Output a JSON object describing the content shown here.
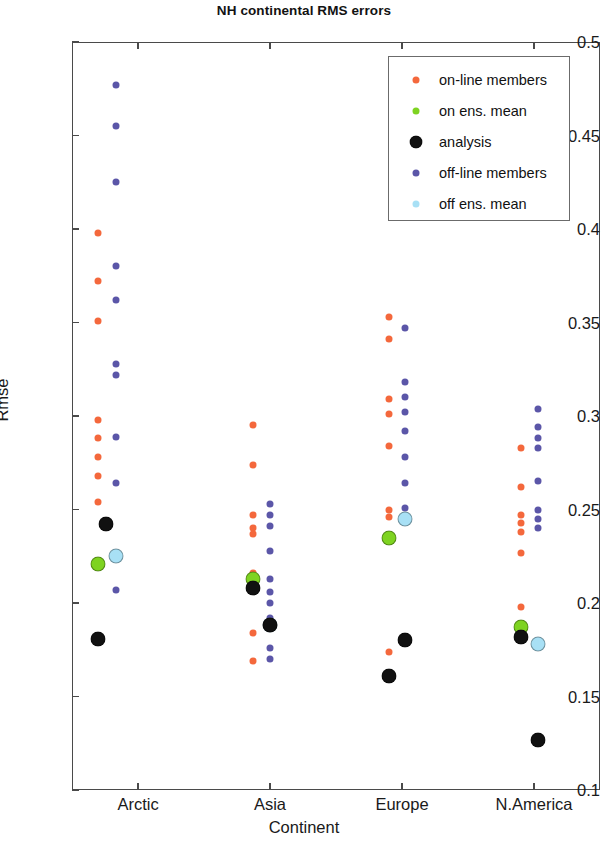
{
  "chart_data": {
    "type": "scatter",
    "title": "NH continental RMS errors",
    "xlabel": "Continent",
    "ylabel": "Rmse",
    "categories": [
      "Arctic",
      "Asia",
      "Europe",
      "N.America"
    ],
    "ylim": [
      0.1,
      0.5
    ],
    "yticks": [
      0.1,
      0.15,
      0.2,
      0.25,
      0.3,
      0.35,
      0.4,
      0.45,
      0.5
    ],
    "ytick_labels": [
      "0.1",
      "0.15",
      "0.2",
      "0.25",
      "0.3",
      "0.35",
      "0.4",
      "0.45",
      "0.5"
    ],
    "grid": false,
    "legend_position": "top-right",
    "colors": {
      "on-line members": "#f4683c",
      "on ens. mean": "#7ed321",
      "analysis": "#111111",
      "off-line members": "#5b56a8",
      "off ens. mean": "#a8e0f5"
    },
    "legend": [
      {
        "label": "on-line members",
        "color": "#f4683c",
        "size": "small"
      },
      {
        "label": "on ens. mean",
        "color": "#7ed321",
        "size": "small"
      },
      {
        "label": " analysis",
        "color": "#111111",
        "size": "big"
      },
      {
        "label": "off-line members",
        "color": "#5b56a8",
        "size": "small"
      },
      {
        "label": "off ens. mean",
        "color": "#a8e0f5",
        "size": "small"
      }
    ],
    "series": [
      {
        "name": "on-line members",
        "color": "#f4683c",
        "size": "small",
        "points": [
          {
            "cat": "Arctic",
            "dx": -0.3,
            "y": 0.398
          },
          {
            "cat": "Arctic",
            "dx": -0.3,
            "y": 0.372
          },
          {
            "cat": "Arctic",
            "dx": -0.3,
            "y": 0.351
          },
          {
            "cat": "Arctic",
            "dx": -0.3,
            "y": 0.298
          },
          {
            "cat": "Arctic",
            "dx": -0.3,
            "y": 0.288
          },
          {
            "cat": "Arctic",
            "dx": -0.3,
            "y": 0.278
          },
          {
            "cat": "Arctic",
            "dx": -0.3,
            "y": 0.268
          },
          {
            "cat": "Arctic",
            "dx": -0.3,
            "y": 0.254
          },
          {
            "cat": "Asia",
            "dx": -0.13,
            "y": 0.295
          },
          {
            "cat": "Asia",
            "dx": -0.13,
            "y": 0.274
          },
          {
            "cat": "Asia",
            "dx": -0.13,
            "y": 0.247
          },
          {
            "cat": "Asia",
            "dx": -0.13,
            "y": 0.24
          },
          {
            "cat": "Asia",
            "dx": -0.13,
            "y": 0.237
          },
          {
            "cat": "Asia",
            "dx": -0.13,
            "y": 0.216
          },
          {
            "cat": "Asia",
            "dx": -0.13,
            "y": 0.21
          },
          {
            "cat": "Asia",
            "dx": -0.13,
            "y": 0.184
          },
          {
            "cat": "Asia",
            "dx": -0.13,
            "y": 0.169
          },
          {
            "cat": "Europe",
            "dx": -0.1,
            "y": 0.353
          },
          {
            "cat": "Europe",
            "dx": -0.1,
            "y": 0.341
          },
          {
            "cat": "Europe",
            "dx": -0.1,
            "y": 0.309
          },
          {
            "cat": "Europe",
            "dx": -0.1,
            "y": 0.301
          },
          {
            "cat": "Europe",
            "dx": -0.1,
            "y": 0.284
          },
          {
            "cat": "Europe",
            "dx": -0.1,
            "y": 0.25
          },
          {
            "cat": "Europe",
            "dx": -0.1,
            "y": 0.246
          },
          {
            "cat": "Europe",
            "dx": -0.1,
            "y": 0.174
          },
          {
            "cat": "N.America",
            "dx": -0.1,
            "y": 0.283
          },
          {
            "cat": "N.America",
            "dx": -0.1,
            "y": 0.262
          },
          {
            "cat": "N.America",
            "dx": -0.1,
            "y": 0.247
          },
          {
            "cat": "N.America",
            "dx": -0.1,
            "y": 0.243
          },
          {
            "cat": "N.America",
            "dx": -0.1,
            "y": 0.238
          },
          {
            "cat": "N.America",
            "dx": -0.1,
            "y": 0.227
          },
          {
            "cat": "N.America",
            "dx": -0.1,
            "y": 0.198
          }
        ]
      },
      {
        "name": "off-line members",
        "color": "#5b56a8",
        "size": "small",
        "points": [
          {
            "cat": "Arctic",
            "dx": -0.17,
            "y": 0.477
          },
          {
            "cat": "Arctic",
            "dx": -0.17,
            "y": 0.455
          },
          {
            "cat": "Arctic",
            "dx": -0.17,
            "y": 0.425
          },
          {
            "cat": "Arctic",
            "dx": -0.17,
            "y": 0.38
          },
          {
            "cat": "Arctic",
            "dx": -0.17,
            "y": 0.362
          },
          {
            "cat": "Arctic",
            "dx": -0.17,
            "y": 0.328
          },
          {
            "cat": "Arctic",
            "dx": -0.17,
            "y": 0.322
          },
          {
            "cat": "Arctic",
            "dx": -0.17,
            "y": 0.289
          },
          {
            "cat": "Arctic",
            "dx": -0.17,
            "y": 0.264
          },
          {
            "cat": "Arctic",
            "dx": -0.17,
            "y": 0.207
          },
          {
            "cat": "Asia",
            "dx": 0.0,
            "y": 0.253
          },
          {
            "cat": "Asia",
            "dx": 0.0,
            "y": 0.247
          },
          {
            "cat": "Asia",
            "dx": 0.0,
            "y": 0.241
          },
          {
            "cat": "Asia",
            "dx": 0.0,
            "y": 0.228
          },
          {
            "cat": "Asia",
            "dx": 0.0,
            "y": 0.213
          },
          {
            "cat": "Asia",
            "dx": 0.0,
            "y": 0.206
          },
          {
            "cat": "Asia",
            "dx": 0.0,
            "y": 0.2
          },
          {
            "cat": "Asia",
            "dx": 0.0,
            "y": 0.192
          },
          {
            "cat": "Asia",
            "dx": 0.0,
            "y": 0.176
          },
          {
            "cat": "Asia",
            "dx": 0.0,
            "y": 0.17
          },
          {
            "cat": "Europe",
            "dx": 0.02,
            "y": 0.347
          },
          {
            "cat": "Europe",
            "dx": 0.02,
            "y": 0.318
          },
          {
            "cat": "Europe",
            "dx": 0.02,
            "y": 0.31
          },
          {
            "cat": "Europe",
            "dx": 0.02,
            "y": 0.302
          },
          {
            "cat": "Europe",
            "dx": 0.02,
            "y": 0.292
          },
          {
            "cat": "Europe",
            "dx": 0.02,
            "y": 0.278
          },
          {
            "cat": "Europe",
            "dx": 0.02,
            "y": 0.264
          },
          {
            "cat": "Europe",
            "dx": 0.02,
            "y": 0.251
          },
          {
            "cat": "N.America",
            "dx": 0.03,
            "y": 0.304
          },
          {
            "cat": "N.America",
            "dx": 0.03,
            "y": 0.294
          },
          {
            "cat": "N.America",
            "dx": 0.03,
            "y": 0.288
          },
          {
            "cat": "N.America",
            "dx": 0.03,
            "y": 0.283
          },
          {
            "cat": "N.America",
            "dx": 0.03,
            "y": 0.265
          },
          {
            "cat": "N.America",
            "dx": 0.03,
            "y": 0.25
          },
          {
            "cat": "N.America",
            "dx": 0.03,
            "y": 0.245
          },
          {
            "cat": "N.America",
            "dx": 0.03,
            "y": 0.24
          }
        ]
      },
      {
        "name": "on ens. mean",
        "color": "#7ed321",
        "size": "big",
        "points": [
          {
            "cat": "Arctic",
            "dx": -0.3,
            "y": 0.221
          },
          {
            "cat": "Asia",
            "dx": -0.13,
            "y": 0.213
          },
          {
            "cat": "Europe",
            "dx": -0.1,
            "y": 0.235
          },
          {
            "cat": "N.America",
            "dx": -0.1,
            "y": 0.187
          }
        ]
      },
      {
        "name": "off ens. mean",
        "color": "#a8e0f5",
        "size": "big",
        "points": [
          {
            "cat": "Arctic",
            "dx": -0.17,
            "y": 0.225
          },
          {
            "cat": "Asia",
            "dx": 0.0,
            "y": 0.188
          },
          {
            "cat": "Europe",
            "dx": 0.02,
            "y": 0.245
          },
          {
            "cat": "N.America",
            "dx": 0.03,
            "y": 0.178
          }
        ]
      },
      {
        "name": "analysis",
        "color": "#111111",
        "size": "big",
        "points": [
          {
            "cat": "Arctic",
            "dx": -0.24,
            "y": 0.242
          },
          {
            "cat": "Arctic",
            "dx": -0.3,
            "y": 0.181
          },
          {
            "cat": "Asia",
            "dx": -0.13,
            "y": 0.208
          },
          {
            "cat": "Asia",
            "dx": 0.0,
            "y": 0.188
          },
          {
            "cat": "Europe",
            "dx": 0.02,
            "y": 0.18
          },
          {
            "cat": "Europe",
            "dx": -0.1,
            "y": 0.161
          },
          {
            "cat": "N.America",
            "dx": -0.1,
            "y": 0.182
          },
          {
            "cat": "N.America",
            "dx": 0.03,
            "y": 0.127
          }
        ]
      }
    ]
  }
}
